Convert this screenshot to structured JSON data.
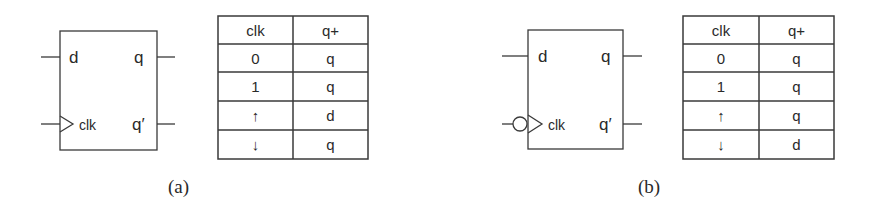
{
  "diagrams": [
    {
      "id": "a",
      "caption": "(a)",
      "flipflop": {
        "inputs": {
          "d": "d",
          "clk": "clk"
        },
        "outputs": {
          "q": "q",
          "qbar": "q′"
        },
        "clock_edge": "rising",
        "inverted_clock_bubble": false
      },
      "table": {
        "headers": [
          "clk",
          "q+"
        ],
        "rows": [
          [
            "0",
            "q"
          ],
          [
            "1",
            "q"
          ],
          [
            "↑",
            "d"
          ],
          [
            "↓",
            "q"
          ]
        ]
      }
    },
    {
      "id": "b",
      "caption": "(b)",
      "flipflop": {
        "inputs": {
          "d": "d",
          "clk": "clk"
        },
        "outputs": {
          "q": "q",
          "qbar": "q′"
        },
        "clock_edge": "falling",
        "inverted_clock_bubble": true
      },
      "table": {
        "headers": [
          "clk",
          "q+"
        ],
        "rows": [
          [
            "0",
            "q"
          ],
          [
            "1",
            "q"
          ],
          [
            "↑",
            "q"
          ],
          [
            "↓",
            "d"
          ]
        ]
      }
    }
  ],
  "colors": {
    "stroke": "#3a3a3a",
    "text": "#2a2a2a",
    "background": "#ffffff"
  }
}
